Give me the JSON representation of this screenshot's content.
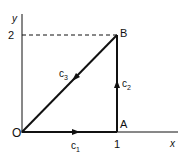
{
  "diagram": {
    "type": "line-integral-path",
    "axes": {
      "x_label": "x",
      "y_label": "y",
      "x_tick": "1",
      "y_tick": "2"
    },
    "points": {
      "origin": {
        "label": "O",
        "coords": [
          0,
          0
        ]
      },
      "A": {
        "label": "A",
        "coords": [
          1,
          0
        ]
      },
      "B": {
        "label": "B",
        "coords": [
          1,
          2
        ]
      }
    },
    "paths": [
      {
        "name": "c1",
        "label_main": "c",
        "label_sub": "1",
        "from": "O",
        "to": "A",
        "direction": "right"
      },
      {
        "name": "c2",
        "label_main": "c",
        "label_sub": "2",
        "from": "A",
        "to": "B",
        "direction": "up"
      },
      {
        "name": "c3",
        "label_main": "c",
        "label_sub": "3",
        "from": "B",
        "to": "O",
        "direction": "down-left"
      }
    ],
    "colors": {
      "stroke": "#111111",
      "background": "#ffffff"
    }
  }
}
